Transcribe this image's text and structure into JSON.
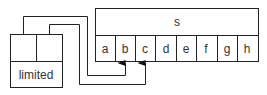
{
  "diagram": {
    "struct_box": {
      "label": "limited"
    },
    "string_box": {
      "label": "s",
      "cells": [
        "a",
        "b",
        "c",
        "d",
        "e",
        "f",
        "g",
        "h"
      ]
    },
    "colors": {
      "stroke": "#222222",
      "text": "#333333",
      "background": "#ffffff"
    }
  }
}
